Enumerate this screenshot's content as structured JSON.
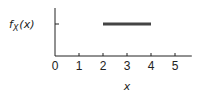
{
  "chart_data": {
    "type": "line",
    "title": "",
    "xlabel": "x",
    "ylabel": "f_X(x)",
    "ylabel_main": "f",
    "ylabel_sub": "X",
    "ylabel_arg": "(x)",
    "xlim": [
      0,
      5.7
    ],
    "x_ticks": [
      0,
      1,
      2,
      3,
      4,
      5
    ],
    "x_tick_labels": [
      "0",
      "1",
      "2",
      "3",
      "4",
      "5"
    ],
    "y_ticks_unlabeled": 1,
    "grid": false,
    "legend": "none",
    "series": [
      {
        "name": "uniform density",
        "x": [
          2,
          4
        ],
        "y": [
          1,
          1
        ]
      }
    ],
    "colors": {
      "line": "#444444",
      "axis": "#222222"
    }
  }
}
